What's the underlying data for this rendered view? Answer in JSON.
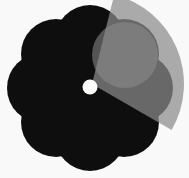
{
  "canvas": {
    "width": 189,
    "height": 178,
    "background_color": "#ffffff",
    "title": "Flower shape with translucent gray overlay"
  },
  "graphic": {
    "name": "flower-graphic",
    "description": "Eight-petal rounded flower silhouette in near-black with a white circular hole at its center, partially covered by a translucent light gray circle and a lighter gray pie wedge radiating from the center.",
    "noise_texture": "film-grain"
  },
  "flower": {
    "label": "flower-silhouette",
    "fill_color": "#100d0c",
    "center_x": 90,
    "center_y": 88,
    "petal_count": 8,
    "petal_radius": 35,
    "petal_orbit_radius": 48,
    "core_radius": 46,
    "bounds": {
      "left": 8,
      "top": 5,
      "right": 172,
      "bottom": 172
    },
    "petals": [
      {
        "index": 0,
        "angle_deg": 270,
        "cx": 90,
        "cy": 40
      },
      {
        "index": 1,
        "angle_deg": 315,
        "cx": 124,
        "cy": 54
      },
      {
        "index": 2,
        "angle_deg": 0,
        "cx": 138,
        "cy": 88
      },
      {
        "index": 3,
        "angle_deg": 45,
        "cx": 124,
        "cy": 122
      },
      {
        "index": 4,
        "angle_deg": 90,
        "cx": 90,
        "cy": 136
      },
      {
        "index": 5,
        "angle_deg": 135,
        "cx": 56,
        "cy": 122
      },
      {
        "index": 6,
        "angle_deg": 180,
        "cx": 42,
        "cy": 88
      },
      {
        "index": 7,
        "angle_deg": 225,
        "cx": 56,
        "cy": 54
      }
    ]
  },
  "center_hole": {
    "label": "center-hole",
    "fill_color": "#fbfbfa",
    "cx": 90,
    "cy": 87,
    "r": 7.5
  },
  "overlay_circle": {
    "label": "translucent-gray-circle",
    "fill_color": "#808080",
    "opacity": 0.62,
    "cx": 125,
    "cy": 55,
    "r": 33
  },
  "overlay_wedge": {
    "label": "gray-pie-wedge",
    "fill_color": "#8a8a8a",
    "opacity": 0.72,
    "apex_x": 92,
    "apex_y": 84,
    "start_angle_deg": 284,
    "end_angle_deg": 30,
    "radius": 92
  },
  "palette": {
    "background": "#ffffff",
    "silhouette": "#100d0c",
    "hole": "#fbfbfa",
    "overlay_light": "#b0b0b0",
    "overlay_mid": "#8d8d8d",
    "overlay_dark": "#4a4745"
  }
}
